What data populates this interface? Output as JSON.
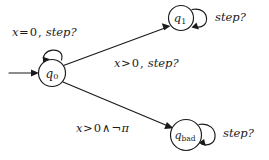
{
  "diagram": {
    "type": "state-machine",
    "background_color": "#ffffff",
    "stroke_color": "#1a1a1a",
    "states": [
      {
        "id": "q0",
        "label": "q",
        "subscript": "0",
        "cx": 52,
        "cy": 73,
        "r": 13.5,
        "is_initial": true
      },
      {
        "id": "q1",
        "label": "q",
        "subscript": "1",
        "cx": 181,
        "cy": 18,
        "r": 12.5,
        "is_initial": false
      },
      {
        "id": "qbad",
        "label": "q",
        "subscript": "bad",
        "cx": 186,
        "cy": 135,
        "r": 15.5,
        "is_initial": false
      }
    ],
    "transitions": [
      {
        "id": "t-initial",
        "from": "",
        "to": "q0",
        "label": ""
      },
      {
        "id": "t-q0-q1",
        "from": "q0",
        "to": "q1",
        "label": "x > 0, step?"
      },
      {
        "id": "t-q0-qbad",
        "from": "q0",
        "to": "qbad",
        "label": "x > 0 ∧ ¬π"
      }
    ],
    "self_loops": [
      {
        "id": "loop-q0",
        "state": "q0",
        "label": "x = 0, step?"
      },
      {
        "id": "loop-q1",
        "state": "q1",
        "label": "step?"
      },
      {
        "id": "loop-qbad",
        "state": "qbad",
        "label": "step?"
      }
    ],
    "labels": {
      "q0_loop": {
        "x_var": "x",
        "relation": "=",
        "value": "0",
        "comma": ",",
        "event": "step?"
      },
      "q0_to_q1": {
        "x_var": "x",
        "relation": ">",
        "value": "0",
        "comma": ",",
        "event": "step?"
      },
      "q0_to_qbad": {
        "x_var": "x",
        "relation": ">",
        "value": "0",
        "conj": "∧",
        "negation": "¬",
        "prop": "π"
      },
      "q1_loop_event": "step?",
      "qbad_loop_event": "step?"
    }
  }
}
